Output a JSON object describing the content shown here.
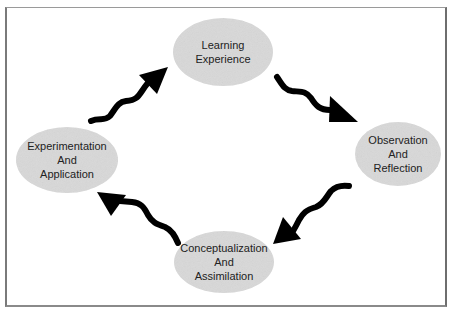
{
  "diagram": {
    "type": "cycle",
    "colors": {
      "node_fill": "#d9d9d9",
      "arrow": "#000000",
      "text": "#222222",
      "frame": "#7a7a7a",
      "background": "#ffffff"
    },
    "nodes": [
      {
        "id": "learning-experience",
        "lines": [
          "Learning",
          "Experience"
        ],
        "cx": 223,
        "cy": 52,
        "rx": 50,
        "ry": 34
      },
      {
        "id": "observation-and-reflection",
        "lines": [
          "Observation",
          "And",
          "Reflection"
        ],
        "cx": 398,
        "cy": 154,
        "rx": 43,
        "ry": 32
      },
      {
        "id": "conceptualization-and-assimilation",
        "lines": [
          "Conceptualization",
          "And",
          "Assimilation"
        ],
        "cx": 224,
        "cy": 262,
        "rx": 50,
        "ry": 31
      },
      {
        "id": "experimentation-and-application",
        "lines": [
          "Experimentation",
          "And",
          "Application"
        ],
        "cx": 67,
        "cy": 160,
        "rx": 51,
        "ry": 33
      }
    ],
    "edges": [
      {
        "from": "experimentation-and-application",
        "to": "learning-experience",
        "style": "wavy-arrow"
      },
      {
        "from": "learning-experience",
        "to": "observation-and-reflection",
        "style": "wavy-arrow"
      },
      {
        "from": "observation-and-reflection",
        "to": "conceptualization-and-assimilation",
        "style": "wavy-arrow"
      },
      {
        "from": "conceptualization-and-assimilation",
        "to": "experimentation-and-application",
        "style": "wavy-arrow"
      }
    ]
  }
}
